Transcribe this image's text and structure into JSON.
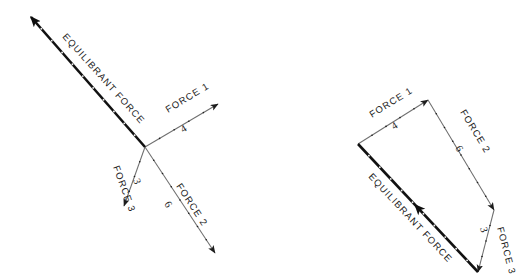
{
  "figure": {
    "background_color": "#ffffff",
    "ink_color": "#1b1b1b",
    "light_line_color": "#6f6f6f",
    "heavy_line_color": "#111111"
  },
  "diagram_left": {
    "name": "concurrent-force-diagram",
    "origin_label": "",
    "vectors": [
      {
        "id": "force-1",
        "name_label": "FORCE 1",
        "magnitude_label": "4",
        "weight": "light",
        "from": [
          145,
          147
        ],
        "to": [
          218,
          104
        ],
        "label_pos": [
          168,
          113
        ],
        "label_angle": -31,
        "mag_pos": [
          183,
          133
        ],
        "mag_angle": -31
      },
      {
        "id": "force-2",
        "name_label": "FORCE 2",
        "magnitude_label": "6",
        "weight": "light",
        "from": [
          145,
          147
        ],
        "to": [
          215,
          253
        ],
        "label_pos": [
          176,
          186
        ],
        "label_angle": 57,
        "mag_pos": [
          164,
          204
        ],
        "mag_angle": 57
      },
      {
        "id": "force-3",
        "name_label": "FORCE 3",
        "magnitude_label": "3",
        "weight": "light",
        "from": [
          145,
          147
        ],
        "to": [
          124,
          206
        ],
        "label_pos": [
          113,
          167
        ],
        "label_angle": 70,
        "mag_pos": [
          133,
          180
        ],
        "mag_angle": 70
      },
      {
        "id": "equilibrant-force",
        "name_label": "EQUILIBRANT FORCE",
        "magnitude_label": "",
        "weight": "heavy",
        "from": [
          145,
          147
        ],
        "to": [
          31,
          17
        ],
        "label_pos": [
          62,
          37
        ],
        "label_angle": 48
      }
    ]
  },
  "diagram_right": {
    "name": "force-polygon-diagram",
    "vectors": [
      {
        "id": "force-1",
        "name_label": "FORCE 1",
        "magnitude_label": "4",
        "weight": "light",
        "from": [
          358,
          144
        ],
        "to": [
          428,
          100
        ],
        "label_pos": [
          372,
          118
        ],
        "label_angle": -32,
        "mag_pos": [
          394,
          130
        ],
        "mag_angle": -32
      },
      {
        "id": "force-2",
        "name_label": "FORCE 2",
        "magnitude_label": "6",
        "weight": "light",
        "from": [
          428,
          100
        ],
        "to": [
          494,
          210
        ],
        "label_pos": [
          460,
          112
        ],
        "label_angle": 59,
        "mag_pos": [
          455,
          148
        ],
        "mag_angle": 59
      },
      {
        "id": "force-3",
        "name_label": "FORCE 3",
        "magnitude_label": "3",
        "weight": "light",
        "from": [
          494,
          210
        ],
        "to": [
          478,
          272
        ],
        "label_pos": [
          497,
          228
        ],
        "label_angle": 75,
        "mag_pos": [
          480,
          228
        ],
        "mag_angle": 75
      },
      {
        "id": "equilibrant-force",
        "name_label": "EQUILIBRANT FORCE",
        "magnitude_label": "",
        "weight": "heavy",
        "from": [
          478,
          272
        ],
        "to": [
          358,
          144
        ],
        "label_pos": [
          368,
          177
        ],
        "label_angle": 47
      }
    ]
  }
}
